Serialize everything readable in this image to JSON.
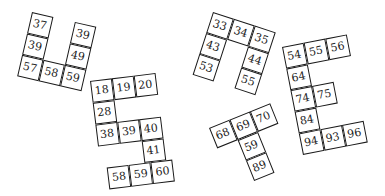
{
  "cell_size": 22,
  "pieces": [
    {
      "id": "A",
      "x": 32,
      "y": 12,
      "rotate": 13,
      "cells": [
        {
          "col": 0,
          "row": 0,
          "label": "37"
        },
        {
          "col": 0,
          "row": 1,
          "label": "39"
        },
        {
          "col": 0,
          "row": 2,
          "label": "57"
        },
        {
          "col": 1,
          "row": 2,
          "label": "58"
        },
        {
          "col": 2,
          "row": 2,
          "label": "59"
        },
        {
          "col": 2,
          "row": 1,
          "label": "49"
        },
        {
          "col": 2,
          "row": 0,
          "label": "39"
        }
      ]
    },
    {
      "id": "B",
      "x": 90,
      "y": 81,
      "rotate": -7,
      "cells": [
        {
          "col": 0,
          "row": 0,
          "label": "18"
        },
        {
          "col": 1,
          "row": 0,
          "label": "19"
        },
        {
          "col": 2,
          "row": 0,
          "label": "20"
        },
        {
          "col": 0,
          "row": 1,
          "label": "28"
        },
        {
          "col": 0,
          "row": 2,
          "label": "38"
        },
        {
          "col": 1,
          "row": 2,
          "label": "39"
        },
        {
          "col": 2,
          "row": 2,
          "label": "40"
        },
        {
          "col": 2,
          "row": 3,
          "label": "41"
        },
        {
          "col": 0.3,
          "row": 4,
          "label": "58"
        },
        {
          "col": 1.3,
          "row": 4,
          "label": "59"
        },
        {
          "col": 2.3,
          "row": 4,
          "label": "60"
        }
      ]
    },
    {
      "id": "C",
      "x": 213,
      "y": 12,
      "rotate": 18,
      "cells": [
        {
          "col": 0,
          "row": 0,
          "label": "33"
        },
        {
          "col": 1,
          "row": 0,
          "label": "34"
        },
        {
          "col": 2,
          "row": 0,
          "label": "35"
        },
        {
          "col": 0,
          "row": 1,
          "label": "43"
        },
        {
          "col": 0,
          "row": 2,
          "label": "53"
        },
        {
          "col": 2,
          "row": 1,
          "label": "44"
        },
        {
          "col": 2,
          "row": 2,
          "label": "55"
        }
      ]
    },
    {
      "id": "D",
      "x": 209,
      "y": 128,
      "rotate": -22,
      "cells": [
        {
          "col": 0,
          "row": 0,
          "label": "68"
        },
        {
          "col": 1,
          "row": 0,
          "label": "69"
        },
        {
          "col": 2,
          "row": 0,
          "label": "70"
        },
        {
          "col": 1,
          "row": 1,
          "label": "59"
        },
        {
          "col": 1,
          "row": 2,
          "label": "89"
        }
      ]
    },
    {
      "id": "E",
      "x": 282,
      "y": 47,
      "rotate": -11,
      "cells": [
        {
          "col": 0,
          "row": 0,
          "label": "54"
        },
        {
          "col": 1,
          "row": 0,
          "label": "55"
        },
        {
          "col": 2,
          "row": 0,
          "label": "56"
        },
        {
          "col": 0,
          "row": 1,
          "label": "64"
        },
        {
          "col": 0,
          "row": 2,
          "label": "74"
        },
        {
          "col": 1,
          "row": 2,
          "label": "75"
        },
        {
          "col": 0,
          "row": 3,
          "label": "84"
        },
        {
          "col": 0,
          "row": 4,
          "label": "94"
        },
        {
          "col": 1,
          "row": 4,
          "label": "93"
        },
        {
          "col": 2,
          "row": 4,
          "label": "96"
        }
      ]
    }
  ]
}
